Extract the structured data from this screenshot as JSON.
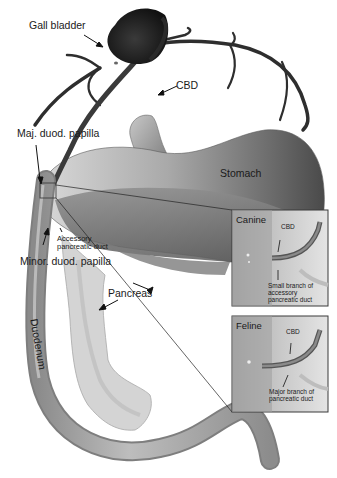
{
  "figure": {
    "type": "anatomical-illustration",
    "colors": {
      "background": "#ffffff",
      "gall_bladder": "#222222",
      "ducts": "#333333",
      "stomach_light": "#b8b8b8",
      "stomach_dark": "#555555",
      "duodenum": "#9a9a9a",
      "pancreas": "#d6d6d6",
      "inset_border": "#3a3a3a",
      "text": "#1a1a1a"
    }
  },
  "labels": {
    "gall_bladder": "Gall bladder",
    "cbd": "CBD",
    "maj_papilla": "Maj. duod. papilla",
    "stomach": "Stomach",
    "accessory_duct": "Accessory\npancreatic duct",
    "minor_papilla": "Minor. duod. papilla",
    "pancreas": "Pancreas",
    "duodenum": "Duodenum"
  },
  "insets": [
    {
      "title": "Canine",
      "cbd_label": "CBD",
      "annotation": "Small branch of\naccessory\npancreatic duct"
    },
    {
      "title": "Feline",
      "cbd_label": "CBD",
      "annotation": "Major branch of\npancreatic duct"
    }
  ]
}
